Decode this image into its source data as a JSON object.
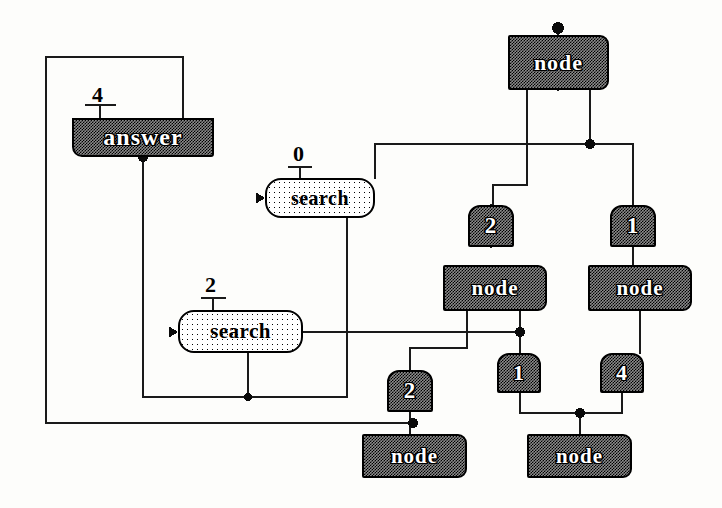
{
  "diagram": {
    "background_color": "#fdfdfb",
    "wire_color": "#1a1a1a",
    "box_fill_color": "#8c8c8c",
    "pill_fill_color": "#ffffff",
    "text_outline_color": "#000000"
  },
  "boxes": [
    {
      "id": "answer",
      "label": "answer",
      "kind": "operator",
      "x": 72,
      "y": 118,
      "w": 142,
      "h": 39,
      "font_size": 24
    },
    {
      "id": "node-top",
      "label": "node",
      "kind": "node",
      "x": 508,
      "y": 35,
      "w": 101,
      "h": 55,
      "font_size": 22
    },
    {
      "id": "node-mid-l",
      "label": "node",
      "kind": "node",
      "x": 443,
      "y": 265,
      "w": 104,
      "h": 46,
      "font_size": 21
    },
    {
      "id": "node-mid-r",
      "label": "node",
      "kind": "node",
      "x": 588,
      "y": 265,
      "w": 104,
      "h": 46,
      "font_size": 21
    },
    {
      "id": "node-bot-l",
      "label": "node",
      "kind": "node",
      "x": 362,
      "y": 434,
      "w": 105,
      "h": 44,
      "font_size": 21
    },
    {
      "id": "node-bot-r",
      "label": "node",
      "kind": "node",
      "x": 527,
      "y": 434,
      "w": 105,
      "h": 44,
      "font_size": 21
    }
  ],
  "numboxes": [
    {
      "id": "num-2-top",
      "label": "2",
      "x": 468,
      "y": 205,
      "w": 46,
      "h": 42,
      "font_size": 23
    },
    {
      "id": "num-1-top",
      "label": "1",
      "x": 610,
      "y": 205,
      "w": 46,
      "h": 42,
      "font_size": 23
    },
    {
      "id": "num-1-mid",
      "label": "1",
      "x": 497,
      "y": 353,
      "w": 44,
      "h": 40,
      "font_size": 22
    },
    {
      "id": "num-4-mid",
      "label": "4",
      "x": 600,
      "y": 353,
      "w": 44,
      "h": 40,
      "font_size": 22
    },
    {
      "id": "num-2-bot",
      "label": "2",
      "x": 387,
      "y": 370,
      "w": 46,
      "h": 42,
      "font_size": 23
    }
  ],
  "pills": [
    {
      "id": "search-0",
      "label": "search",
      "x": 265,
      "y": 178,
      "w": 110,
      "h": 40,
      "font_size": 20
    },
    {
      "id": "search-2",
      "label": "search",
      "x": 178,
      "y": 310,
      "w": 125,
      "h": 43,
      "font_size": 21
    }
  ],
  "arg_labels": [
    {
      "id": "arg-4",
      "label": "4",
      "x": 92,
      "y": 84,
      "font_size": 22
    },
    {
      "id": "arg-0",
      "label": "0",
      "x": 293,
      "y": 143,
      "font_size": 22
    },
    {
      "id": "arg-2",
      "label": "2",
      "x": 205,
      "y": 274,
      "font_size": 22
    }
  ],
  "wires": {
    "feedback_loop": "answer top-right output routes left around the whole diagram to the bottom node input",
    "paths": [
      "M183,118 L183,57 L46,57 L46,423 L413,423",
      "M143,157 L143,397 L347,397 L347,218",
      "M248,353 L248,397",
      "M303,332 L520,332",
      "M558,90 L558,50",
      "M527,90 L527,185 L493,185 L493,205",
      "M590,90 L590,144 L633,144 L633,205",
      "M590,144 L375,144 L375,178",
      "M491,205 L491,247",
      "M633,247 L633,265",
      "M467,311 L467,348 L410,348 L410,370",
      "M520,311 L520,353",
      "M410,412 L410,455",
      "M640,311 L640,353",
      "M622,393 L622,413 L580,413 L580,455",
      "M520,393 L520,413 L580,413",
      "M558,35 L558,26"
    ],
    "junction_dots": [
      {
        "x": 143,
        "y": 157,
        "r": 5
      },
      {
        "x": 248,
        "y": 397,
        "r": 4
      },
      {
        "x": 590,
        "y": 144,
        "r": 5
      },
      {
        "x": 520,
        "y": 332,
        "r": 5
      },
      {
        "x": 413,
        "y": 423,
        "r": 5
      },
      {
        "x": 580,
        "y": 413,
        "r": 5
      },
      {
        "x": 558,
        "y": 28,
        "r": 6
      }
    ],
    "arrow_heads": [
      {
        "x": 265,
        "y": 198,
        "dir": "right"
      },
      {
        "x": 178,
        "y": 332,
        "dir": "right"
      }
    ]
  }
}
